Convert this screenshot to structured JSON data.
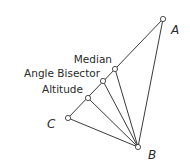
{
  "diagram": {
    "colors": {
      "stroke": "#3a3a3a",
      "text": "#2a2a2a",
      "background": "#ffffff"
    },
    "vertices": {
      "A": {
        "label": "A",
        "x": 163,
        "y": 19
      },
      "B": {
        "label": "B",
        "x": 138,
        "y": 147
      },
      "C": {
        "label": "C",
        "x": 68,
        "y": 118
      }
    },
    "cevians": [
      {
        "name": "Median",
        "label": "Median",
        "foot": {
          "x": 115,
          "y": 69
        }
      },
      {
        "name": "Angle Bisector",
        "label": "Angle Bisector",
        "foot": {
          "x": 103,
          "y": 81
        }
      },
      {
        "name": "Altitude",
        "label": "Altitude",
        "foot": {
          "x": 88,
          "y": 98
        }
      }
    ]
  }
}
